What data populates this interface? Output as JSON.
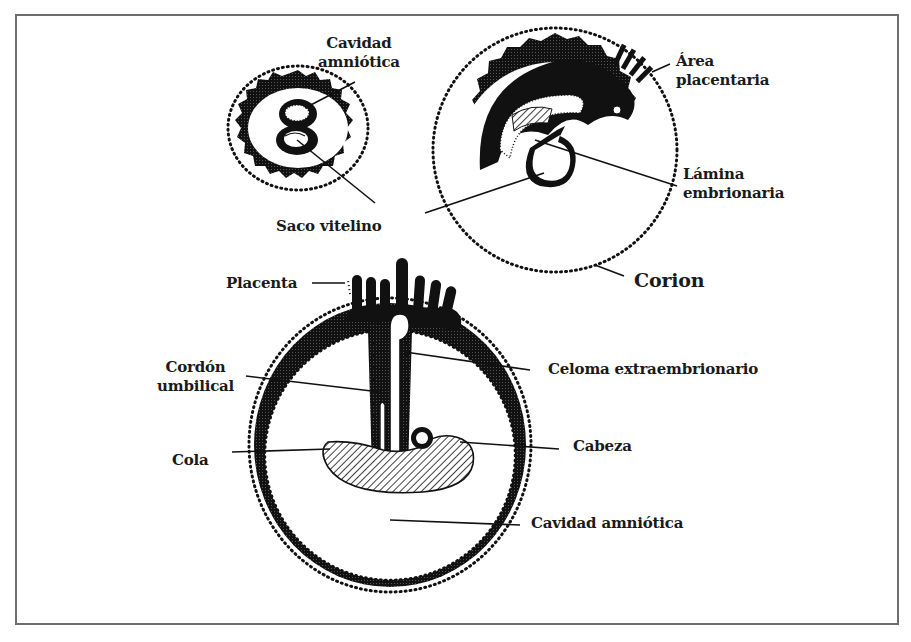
{
  "figure": {
    "colors": {
      "ink": "#111111",
      "frame": "#6e6e6e",
      "background": "#ffffff"
    }
  },
  "stage1": {
    "labels": {
      "cavidad_amniotica_line1": "Cavidad",
      "cavidad_amniotica_line2": "amniótica",
      "saco_vitelino": "Saco vitelino"
    }
  },
  "stage2": {
    "labels": {
      "area_placentaria_line1": "Área",
      "area_placentaria_line2": "placentaria",
      "lamina_embrionaria_line1": "Lámina",
      "lamina_embrionaria_line2": "embrionaria",
      "corion": "Corion"
    }
  },
  "stage3": {
    "labels": {
      "placenta": "Placenta",
      "cordon_umbilical_line1": "Cordón",
      "cordon_umbilical_line2": "umbilical",
      "celoma_extraembrionario": "Celoma extraembrionario",
      "cola": "Cola",
      "cabeza": "Cabeza",
      "cavidad_amniotica": "Cavidad amniótica"
    }
  }
}
